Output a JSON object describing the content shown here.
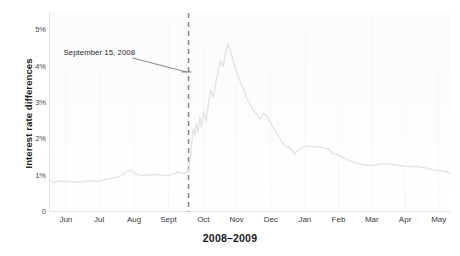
{
  "chart_data": {
    "type": "line",
    "title": "",
    "xlabel": "2008–2009",
    "ylabel": "Interest rate differences",
    "ylim": [
      0,
      5.5
    ],
    "yticks": [
      0,
      1,
      2,
      3,
      4,
      5
    ],
    "ytick_labels": [
      "0",
      "1%",
      "2%",
      "3%",
      "4%",
      "5%"
    ],
    "grid": false,
    "legend": "none",
    "line_color": "#e2e4e6",
    "categories": [
      "Jun",
      "Jul",
      "Aug",
      "Sept",
      "Oct",
      "Nov",
      "Dec",
      "Jan",
      "Feb",
      "Mar",
      "Apr",
      "May"
    ],
    "xtick_positions_fraction": [
      0.042,
      0.125,
      0.212,
      0.298,
      0.385,
      0.468,
      0.553,
      0.638,
      0.722,
      0.805,
      0.888,
      0.972
    ],
    "annotations": [
      {
        "text": "September 15, 2008",
        "kind": "event-marker",
        "x_fraction": 0.348,
        "line_style": "dashed",
        "line_color": "#8c8c8c"
      }
    ],
    "series": [
      {
        "name": "Interest rate difference",
        "x": [
          0.0,
          0.012,
          0.024,
          0.036,
          0.048,
          0.06,
          0.072,
          0.084,
          0.096,
          0.108,
          0.12,
          0.132,
          0.144,
          0.156,
          0.168,
          0.18,
          0.192,
          0.204,
          0.216,
          0.228,
          0.24,
          0.252,
          0.264,
          0.276,
          0.288,
          0.3,
          0.312,
          0.32,
          0.328,
          0.336,
          0.344,
          0.348,
          0.352,
          0.356,
          0.36,
          0.364,
          0.368,
          0.372,
          0.376,
          0.38,
          0.386,
          0.392,
          0.398,
          0.404,
          0.41,
          0.416,
          0.422,
          0.428,
          0.434,
          0.44,
          0.446,
          0.452,
          0.458,
          0.464,
          0.47,
          0.478,
          0.486,
          0.494,
          0.502,
          0.51,
          0.518,
          0.526,
          0.534,
          0.542,
          0.55,
          0.56,
          0.57,
          0.58,
          0.59,
          0.6,
          0.612,
          0.624,
          0.636,
          0.648,
          0.66,
          0.672,
          0.684,
          0.696,
          0.708,
          0.72,
          0.734,
          0.748,
          0.762,
          0.776,
          0.79,
          0.804,
          0.818,
          0.832,
          0.846,
          0.86,
          0.874,
          0.888,
          0.902,
          0.916,
          0.93,
          0.944,
          0.958,
          0.972,
          0.986,
          1.0
        ],
        "values": [
          0.88,
          0.8,
          0.86,
          0.83,
          0.85,
          0.82,
          0.84,
          0.83,
          0.85,
          0.86,
          0.84,
          0.87,
          0.9,
          0.93,
          0.95,
          1.0,
          1.1,
          1.14,
          1.05,
          1.0,
          1.02,
          1.01,
          1.03,
          1.02,
          1.0,
          1.01,
          1.05,
          1.1,
          1.08,
          1.06,
          1.1,
          1.12,
          1.4,
          1.9,
          2.3,
          2.1,
          2.45,
          2.2,
          2.6,
          2.35,
          2.75,
          2.5,
          3.0,
          3.35,
          3.15,
          3.55,
          3.9,
          4.15,
          4.0,
          4.35,
          4.62,
          4.45,
          4.2,
          4.0,
          3.8,
          3.55,
          3.35,
          3.1,
          2.95,
          2.8,
          2.7,
          2.55,
          2.72,
          2.65,
          2.5,
          2.3,
          2.12,
          1.95,
          1.8,
          1.78,
          1.6,
          1.72,
          1.8,
          1.82,
          1.79,
          1.8,
          1.76,
          1.74,
          1.6,
          1.58,
          1.5,
          1.42,
          1.36,
          1.32,
          1.3,
          1.28,
          1.3,
          1.33,
          1.32,
          1.3,
          1.28,
          1.26,
          1.24,
          1.25,
          1.23,
          1.2,
          1.16,
          1.14,
          1.12,
          1.06
        ]
      }
    ]
  }
}
